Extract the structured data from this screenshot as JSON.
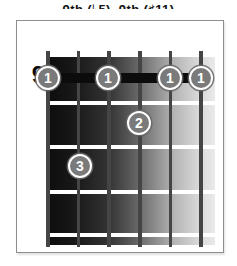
{
  "caption": {
    "text": "9th (♭5), 9th (♯11)",
    "clipped": "top of text cut off at screenshot edge"
  },
  "diagram": {
    "fret_label": "9",
    "strings_count": 6,
    "frets_shown": 4,
    "barre": {
      "fret": 9,
      "from_string": 6,
      "to_string": 1,
      "finger": "1"
    },
    "fingerings": [
      {
        "finger": "1",
        "string": 6,
        "fret": 9
      },
      {
        "finger": "1",
        "string": 4,
        "fret": 9
      },
      {
        "finger": "1",
        "string": 2,
        "fret": 9
      },
      {
        "finger": "1",
        "string": 1,
        "fret": 9
      },
      {
        "finger": "2",
        "string": 3,
        "fret": 10
      },
      {
        "finger": "3",
        "string": 5,
        "fret": 11
      }
    ],
    "colors": {
      "marker_fill": "#7a7a7a",
      "marker_ring": "#ffffff",
      "barre": "#0c0c0c",
      "fret_line": "#ffffff",
      "string": "#454545",
      "board_dark": "#0d0d0d",
      "board_light": "#eaeaea",
      "card_border": "#8e8e8e"
    }
  }
}
